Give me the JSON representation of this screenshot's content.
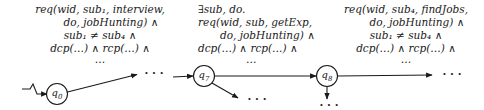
{
  "diagram": {
    "type": "automaton-fragment",
    "nodes": [
      {
        "id": "q0",
        "label": "q",
        "sub": "0"
      },
      {
        "id": "q7",
        "label": "q",
        "sub": "7"
      },
      {
        "id": "q8",
        "label": "q",
        "sub": "8"
      }
    ],
    "ellipsis": "· · ·",
    "labels": {
      "q0_out": {
        "lines": [
          "req(wid, sub₁, interview,",
          "do, jobHunting) ∧",
          "sub₁ ≠ sub₄ ∧",
          "dcp(…) ∧ rcp(…) ∧",
          "…"
        ]
      },
      "q7_out": {
        "lines": [
          "∃sub, do.",
          "req(wid, sub, getExp,",
          "do, jobHunting) ∧",
          "dcp(…) ∧ rcp(…) ∧",
          "…"
        ]
      },
      "q8_out": {
        "lines": [
          "req(wid, sub₄, findJobs,",
          "do, jobHunting) ∧",
          "sub₁ ≠ sub₄ ∧",
          "dcp(…) ∧ rcp(…) ∧",
          "…"
        ]
      }
    }
  }
}
